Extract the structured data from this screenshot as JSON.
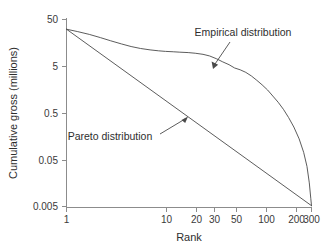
{
  "chart_data": {
    "type": "line",
    "title": "",
    "xlabel": "Rank",
    "ylabel": "Cumulative gross (millions)",
    "xscale": "log",
    "yscale": "log",
    "xlim": [
      1,
      300
    ],
    "ylim": [
      0.005,
      50
    ],
    "grid": false,
    "legend_position": "inline-annotations",
    "xticks": [
      {
        "value": 1,
        "label": "1"
      },
      {
        "value": 10,
        "label": "10"
      },
      {
        "value": 20,
        "label": "20"
      },
      {
        "value": 30,
        "label": "30"
      },
      {
        "value": 50,
        "label": "50"
      },
      {
        "value": 100,
        "label": "100"
      },
      {
        "value": 200,
        "label": "200"
      },
      {
        "value": 300,
        "label": "300"
      }
    ],
    "yticks": [
      {
        "value": 50,
        "label": "50"
      },
      {
        "value": 5,
        "label": "5"
      },
      {
        "value": 0.5,
        "label": "0.5"
      },
      {
        "value": 0.05,
        "label": "0.05"
      },
      {
        "value": 0.005,
        "label": "0.005"
      }
    ],
    "series": [
      {
        "name": "Empirical distribution",
        "x": [
          1,
          1.3,
          1.7,
          2.2,
          2.8,
          3.6,
          4.5,
          5.6,
          7,
          8.5,
          10,
          12,
          14,
          17,
          20,
          24,
          28,
          33,
          38,
          44,
          50,
          57,
          65,
          74,
          84,
          95,
          108,
          122,
          138,
          156,
          176,
          199,
          225,
          250,
          270,
          285,
          295,
          300
        ],
        "y": [
          31.0,
          27.5,
          24.0,
          20.5,
          17.5,
          15.0,
          13.2,
          12.0,
          11.2,
          10.7,
          10.4,
          10.2,
          10.0,
          9.8,
          9.5,
          9.0,
          8.3,
          7.2,
          6.2,
          5.4,
          4.6,
          4.2,
          3.7,
          3.1,
          2.5,
          2.0,
          1.55,
          1.15,
          0.85,
          0.6,
          0.4,
          0.25,
          0.14,
          0.072,
          0.036,
          0.016,
          0.0075,
          0.0052
        ]
      },
      {
        "name": "Pareto distribution",
        "x": [
          1,
          300
        ],
        "y": [
          31.0,
          0.0052
        ]
      }
    ],
    "annotations": [
      {
        "text": "Empirical distribution",
        "label_anchor": [
          243,
          33
        ],
        "arrow_from": [
          228,
          41
        ],
        "arrow_to": [
          213,
          68
        ]
      },
      {
        "text": "Pareto distribution",
        "label_anchor": [
          110,
          137
        ],
        "arrow_from": [
          162,
          132
        ],
        "arrow_to": [
          187,
          117
        ]
      }
    ]
  },
  "axes": {
    "x_title": "Rank",
    "y_title": "Cumulative gross (millions)"
  }
}
